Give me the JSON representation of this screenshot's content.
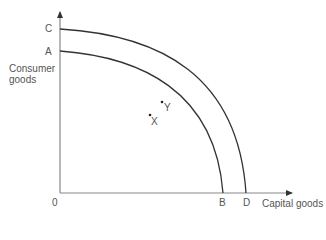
{
  "diagram": {
    "y_axis_label_line1": "Consumer",
    "y_axis_label_line2": "goods",
    "x_axis_label": "Capital goods",
    "origin_label": "0",
    "points": {
      "C": "C",
      "A": "A",
      "B": "B",
      "D": "D",
      "X": "X",
      "Y": "Y"
    },
    "curves": [
      {
        "name": "inner PPF",
        "from": "A",
        "to": "B"
      },
      {
        "name": "outer PPF",
        "from": "C",
        "to": "D"
      }
    ],
    "line_color": "#333333",
    "axis_color": "#777777"
  }
}
